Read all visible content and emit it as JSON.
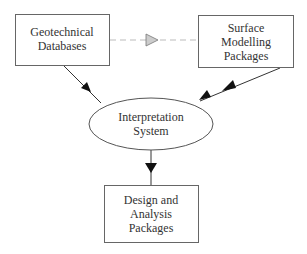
{
  "diagram": {
    "type": "flow",
    "colors": {
      "stroke": "#555555",
      "text": "#333333",
      "dashed": "#aaaaaa",
      "triangle_fill": "#cccccc",
      "background": "#ffffff"
    },
    "nodes": [
      {
        "id": "geotechnical-databases",
        "shape": "rectangle",
        "lines": [
          "Geotechnical",
          "Databases"
        ]
      },
      {
        "id": "surface-modelling-packages",
        "shape": "rectangle",
        "lines": [
          "Surface",
          "Modelling",
          "Packages"
        ]
      },
      {
        "id": "interpretation-system",
        "shape": "ellipse",
        "lines": [
          "Interpretation",
          "System"
        ]
      },
      {
        "id": "design-analysis-packages",
        "shape": "rectangle",
        "lines": [
          "Design and",
          "Analysis",
          "Packages"
        ]
      }
    ],
    "edges": [
      {
        "from": "geotechnical-databases",
        "to": "surface-modelling-packages",
        "style": "dashed",
        "arrow": "hollow-gray-triangle-midpoint"
      },
      {
        "from": "geotechnical-databases",
        "to": "interpretation-system",
        "style": "solid",
        "arrow": "filled"
      },
      {
        "from": "surface-modelling-packages",
        "to": "interpretation-system",
        "style": "solid",
        "arrow": "filled-bidirectional"
      },
      {
        "from": "interpretation-system",
        "to": "design-analysis-packages",
        "style": "solid",
        "arrow": "filled"
      }
    ]
  }
}
